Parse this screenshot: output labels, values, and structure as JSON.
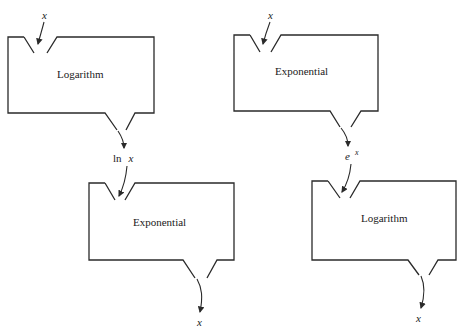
{
  "diagram": {
    "left_chain": {
      "input": "x",
      "machine1": {
        "label": "Logarithm"
      },
      "intermediate": {
        "prefix": "ln",
        "var": "x"
      },
      "machine2": {
        "label": "Exponential"
      },
      "output": "x"
    },
    "right_chain": {
      "input": "x",
      "machine1": {
        "label": "Exponential"
      },
      "intermediate": {
        "base": "e",
        "exponent": "x"
      },
      "machine2": {
        "label": "Logarithm"
      },
      "output": "x"
    },
    "colors": {
      "stroke": "#2a2a2a",
      "text": "#1a1a1a",
      "background": "#ffffff"
    }
  }
}
